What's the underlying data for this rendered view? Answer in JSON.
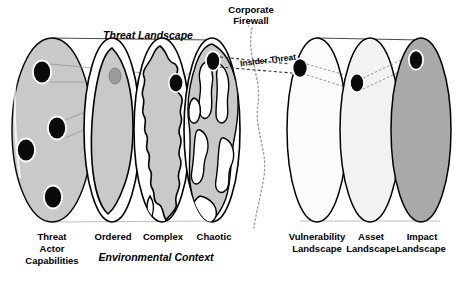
{
  "diagram": {
    "title_threat_landscape": "Threat Landscape",
    "title_environmental_context": "Environmental Context",
    "firewall_label_line1": "Corporate",
    "firewall_label_line2": "Firewall",
    "insider_threat_label": "Insider Threat",
    "colors": {
      "gray_fill": "#c9c9c9",
      "gray_fill_dark": "#a9a9a9",
      "white_fill": "#fbfbfb",
      "light_fill": "#f2f2f2",
      "outline": "#000000",
      "dot_fill": "#0a0a0a",
      "dot_ring": "#ffffff",
      "connector": "#8f8f8f",
      "dashed": "#555555"
    },
    "left_group": {
      "name": "threat-side",
      "ellipses": [
        {
          "id": "threat-actor-capabilities",
          "cx": 52,
          "cy": 130,
          "rx": 40,
          "ry": 92,
          "fill": "#c9c9c9",
          "label_lines": [
            "Threat",
            "Actor",
            "Capabilities"
          ],
          "label_style": "bold",
          "dots": [
            {
              "cx": 42,
              "cy": 72,
              "rx": 9,
              "ry": 11
            },
            {
              "cx": 57,
              "cy": 128,
              "rx": 9,
              "ry": 11
            },
            {
              "cx": 26,
              "cy": 148,
              "rx": 9,
              "ry": 11
            },
            {
              "cx": 53,
              "cy": 196,
              "rx": 9,
              "ry": 11
            }
          ]
        },
        {
          "id": "ordered-landscape",
          "cx": 112,
          "cy": 130,
          "rx": 28,
          "ry": 92,
          "fill": "#ffffff",
          "label_lines": [
            "Ordered"
          ],
          "label_style": "bold",
          "blob": "ordered",
          "dots": [
            {
              "cx": 115,
              "cy": 75,
              "rx": 6,
              "ry": 8,
              "fill": "#9a9a9a"
            }
          ]
        },
        {
          "id": "complex-landscape",
          "cx": 162,
          "cy": 130,
          "rx": 28,
          "ry": 92,
          "fill": "#ffffff",
          "label_lines": [
            "Complex"
          ],
          "label_style": "bold",
          "blob": "complex",
          "dots": [
            {
              "cx": 176,
              "cy": 82,
              "rx": 7,
              "ry": 9
            }
          ]
        },
        {
          "id": "chaotic-landscape",
          "cx": 212,
          "cy": 130,
          "rx": 28,
          "ry": 92,
          "fill": "#ffffff",
          "label_lines": [
            "Chaotic"
          ],
          "label_style": "bold",
          "blob": "chaotic",
          "dots": [
            {
              "cx": 213,
              "cy": 62,
              "rx": 6.5,
              "ry": 9
            }
          ]
        }
      ]
    },
    "right_group": {
      "name": "organisation-side",
      "ellipses": [
        {
          "id": "vulnerability-landscape",
          "cx": 317,
          "cy": 130,
          "rx": 30,
          "ry": 92,
          "fill": "#fbfbfb",
          "label_lines": [
            "Vulnerability",
            "Landscape"
          ],
          "label_style": "bold",
          "dots": [
            {
              "cx": 300,
              "cy": 68,
              "rx": 7,
              "ry": 9
            }
          ]
        },
        {
          "id": "asset-landscape",
          "cx": 370,
          "cy": 130,
          "rx": 30,
          "ry": 92,
          "fill": "#f2f2f2",
          "label_lines": [
            "Asset",
            "Landscape"
          ],
          "label_style": "bold",
          "dots": [
            {
              "cx": 357,
              "cy": 82,
              "rx": 6.5,
              "ry": 8.5
            }
          ]
        },
        {
          "id": "impact-landscape",
          "cx": 421,
          "cy": 130,
          "rx": 30,
          "ry": 92,
          "fill": "#a9a9a9",
          "label_lines": [
            "Impact",
            "Landscape"
          ],
          "label_style": "bold",
          "dots": [
            {
              "cx": 416,
              "cy": 60,
              "rx": 6.5,
              "ry": 9
            }
          ]
        }
      ]
    }
  }
}
